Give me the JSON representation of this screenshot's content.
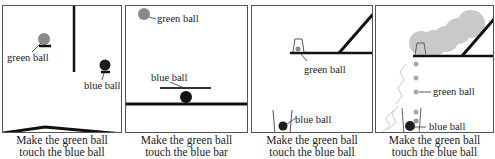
{
  "figure": {
    "top_strip_text": "(a) ...",
    "panels": [
      {
        "id": "panel-1",
        "labels": {
          "green": "green ball",
          "blue": "blue ball"
        },
        "caption": [
          "Make the green ball",
          "touch the blue ball"
        ]
      },
      {
        "id": "panel-2",
        "labels": {
          "green": "green ball",
          "blue": "blue ball"
        },
        "caption": [
          "Make the green ball",
          "touch the blue bar"
        ]
      },
      {
        "id": "panel-3",
        "labels": {
          "green": "green ball",
          "blue": "blue ball"
        },
        "caption": [
          "Make the green ball",
          "touch the blue ball"
        ]
      },
      {
        "id": "panel-4",
        "labels": {
          "green": "green ball",
          "blue": "blue ball"
        },
        "caption": [
          "Make the green ball",
          "touch the blue ball"
        ]
      }
    ],
    "colors": {
      "green_ball": "#8a8a8a",
      "blue_ball": "#1e1e1e",
      "bar": "#111111",
      "border": "#555555",
      "trail": "#9a9a9a"
    }
  }
}
